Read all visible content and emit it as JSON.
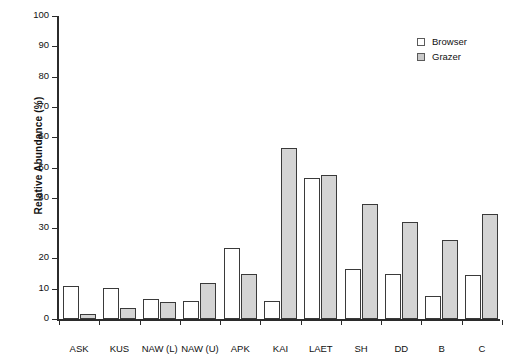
{
  "chart_data": {
    "type": "bar",
    "title": "",
    "xlabel": "",
    "ylabel": "Relative Abundance (%)",
    "ylim": [
      0,
      100
    ],
    "ytick_step": 10,
    "yticks": [
      0,
      10,
      20,
      30,
      40,
      50,
      60,
      70,
      80,
      90,
      100
    ],
    "ytick_labels": [
      "0",
      "10",
      "20",
      "30",
      "40",
      "50",
      "60",
      "70",
      "80",
      "90",
      "100"
    ],
    "grid": false,
    "legend_position": "top-right",
    "categories": [
      "ASK",
      "KUS",
      "NAW (L)",
      "NAW (U)",
      "APK",
      "KAI",
      "LAET",
      "SH",
      "DD",
      "B",
      "C"
    ],
    "series": [
      {
        "name": "Browser",
        "color": "#ffffff",
        "edge_color": "#3a3a3a",
        "values": [
          11,
          10.3,
          6.5,
          6,
          23.5,
          6,
          46.5,
          16.5,
          15,
          7.5,
          14.5
        ]
      },
      {
        "name": "Grazer",
        "color": "#d4d4d4",
        "edge_color": "#3a3a3a",
        "values": [
          1.5,
          3.5,
          5.5,
          12,
          15,
          56.5,
          47.5,
          38,
          32,
          26,
          34.8
        ]
      }
    ]
  },
  "legend": {
    "items": [
      {
        "label": "Browser",
        "swatch": "open-square-icon"
      },
      {
        "label": "Grazer",
        "swatch": "filled-square-icon"
      }
    ]
  }
}
